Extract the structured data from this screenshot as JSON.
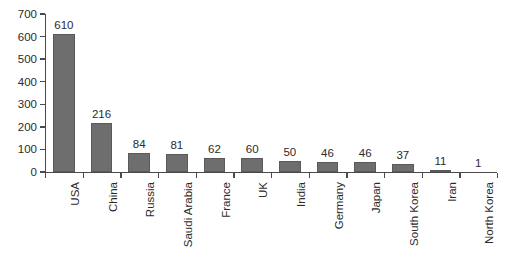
{
  "chart_data": {
    "type": "bar",
    "title": "",
    "subtitle": "",
    "xlabel": "",
    "ylabel": "",
    "categories": [
      "USA",
      "China",
      "Russia",
      "Saudi Arabia",
      "France",
      "UK",
      "India",
      "Germany",
      "Japan",
      "South Korea",
      "Iran",
      "North Korea"
    ],
    "values": [
      610,
      216,
      84,
      81,
      62,
      60,
      50,
      46,
      46,
      37,
      11,
      1
    ],
    "value_labels": [
      "610",
      "216",
      "84",
      "81",
      "62",
      "60",
      "50",
      "46",
      "46",
      "37",
      "11",
      "1"
    ],
    "ylim": [
      0,
      700
    ],
    "ytick_labels": [
      "0",
      "100",
      "200",
      "300",
      "400",
      "500",
      "600",
      "700"
    ],
    "ytick_values": [
      0,
      100,
      200,
      300,
      400,
      500,
      600,
      700
    ],
    "grid": false,
    "legend": false,
    "legend_position": "none",
    "xtick_label_rotation": 90,
    "bar_color": "#6e6e6e",
    "bar_edge_color": "#5a5a5a",
    "axis_color": "#4a4a4a",
    "text_color": "#2b2b2b",
    "background_color": "#ffffff"
  }
}
